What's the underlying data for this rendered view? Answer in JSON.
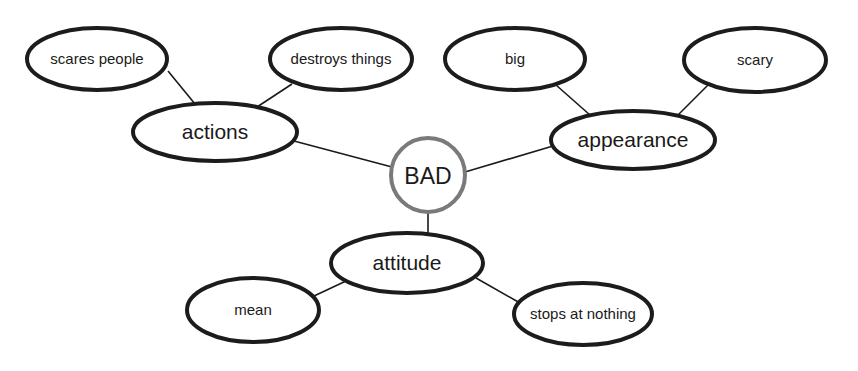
{
  "diagram": {
    "type": "concept-web",
    "center": {
      "id": "bad",
      "label": "BAD",
      "x": 428,
      "y": 175,
      "r": 37,
      "stroke": "#7a7a7a"
    },
    "categories": [
      {
        "id": "actions",
        "label": "actions",
        "x": 215,
        "y": 132,
        "rx": 82,
        "ry": 29
      },
      {
        "id": "appearance",
        "label": "appearance",
        "x": 633,
        "y": 140,
        "rx": 82,
        "ry": 29
      },
      {
        "id": "attitude",
        "label": "attitude",
        "x": 407,
        "y": 263,
        "rx": 76,
        "ry": 30
      }
    ],
    "details": [
      {
        "id": "scares-people",
        "label": "scares people",
        "parent": "actions",
        "x": 97,
        "y": 59,
        "rx": 70,
        "ry": 31
      },
      {
        "id": "destroys-things",
        "label": "destroys things",
        "parent": "actions",
        "x": 341,
        "y": 59,
        "rx": 71,
        "ry": 31
      },
      {
        "id": "big",
        "label": "big",
        "parent": "appearance",
        "x": 515,
        "y": 59,
        "rx": 70,
        "ry": 31
      },
      {
        "id": "scary",
        "label": "scary",
        "parent": "appearance",
        "x": 755,
        "y": 60,
        "rx": 71,
        "ry": 32
      },
      {
        "id": "mean",
        "label": "mean",
        "parent": "attitude",
        "x": 253,
        "y": 310,
        "rx": 66,
        "ry": 32
      },
      {
        "id": "stops-at-nothing",
        "label": "stops at nothing",
        "parent": "attitude",
        "x": 583,
        "y": 314,
        "rx": 69,
        "ry": 31
      }
    ],
    "edges": [
      {
        "from": "bad",
        "to": "actions",
        "x1": 392,
        "y1": 167,
        "x2": 294,
        "y2": 141
      },
      {
        "from": "bad",
        "to": "appearance",
        "x1": 465,
        "y1": 172,
        "x2": 553,
        "y2": 146
      },
      {
        "from": "bad",
        "to": "attitude",
        "x1": 428,
        "y1": 212,
        "x2": 428,
        "y2": 234
      },
      {
        "from": "actions",
        "to": "scares-people",
        "x1": 195,
        "y1": 104,
        "x2": 168,
        "y2": 71
      },
      {
        "from": "actions",
        "to": "destroys-things",
        "x1": 257,
        "y1": 107,
        "x2": 292,
        "y2": 84
      },
      {
        "from": "appearance",
        "to": "big",
        "x1": 590,
        "y1": 115,
        "x2": 556,
        "y2": 85
      },
      {
        "from": "appearance",
        "to": "scary",
        "x1": 678,
        "y1": 115,
        "x2": 708,
        "y2": 85
      },
      {
        "from": "attitude",
        "to": "mean",
        "x1": 346,
        "y1": 281,
        "x2": 314,
        "y2": 296
      },
      {
        "from": "attitude",
        "to": "stops-at-nothing",
        "x1": 476,
        "y1": 278,
        "x2": 520,
        "y2": 303
      }
    ]
  }
}
